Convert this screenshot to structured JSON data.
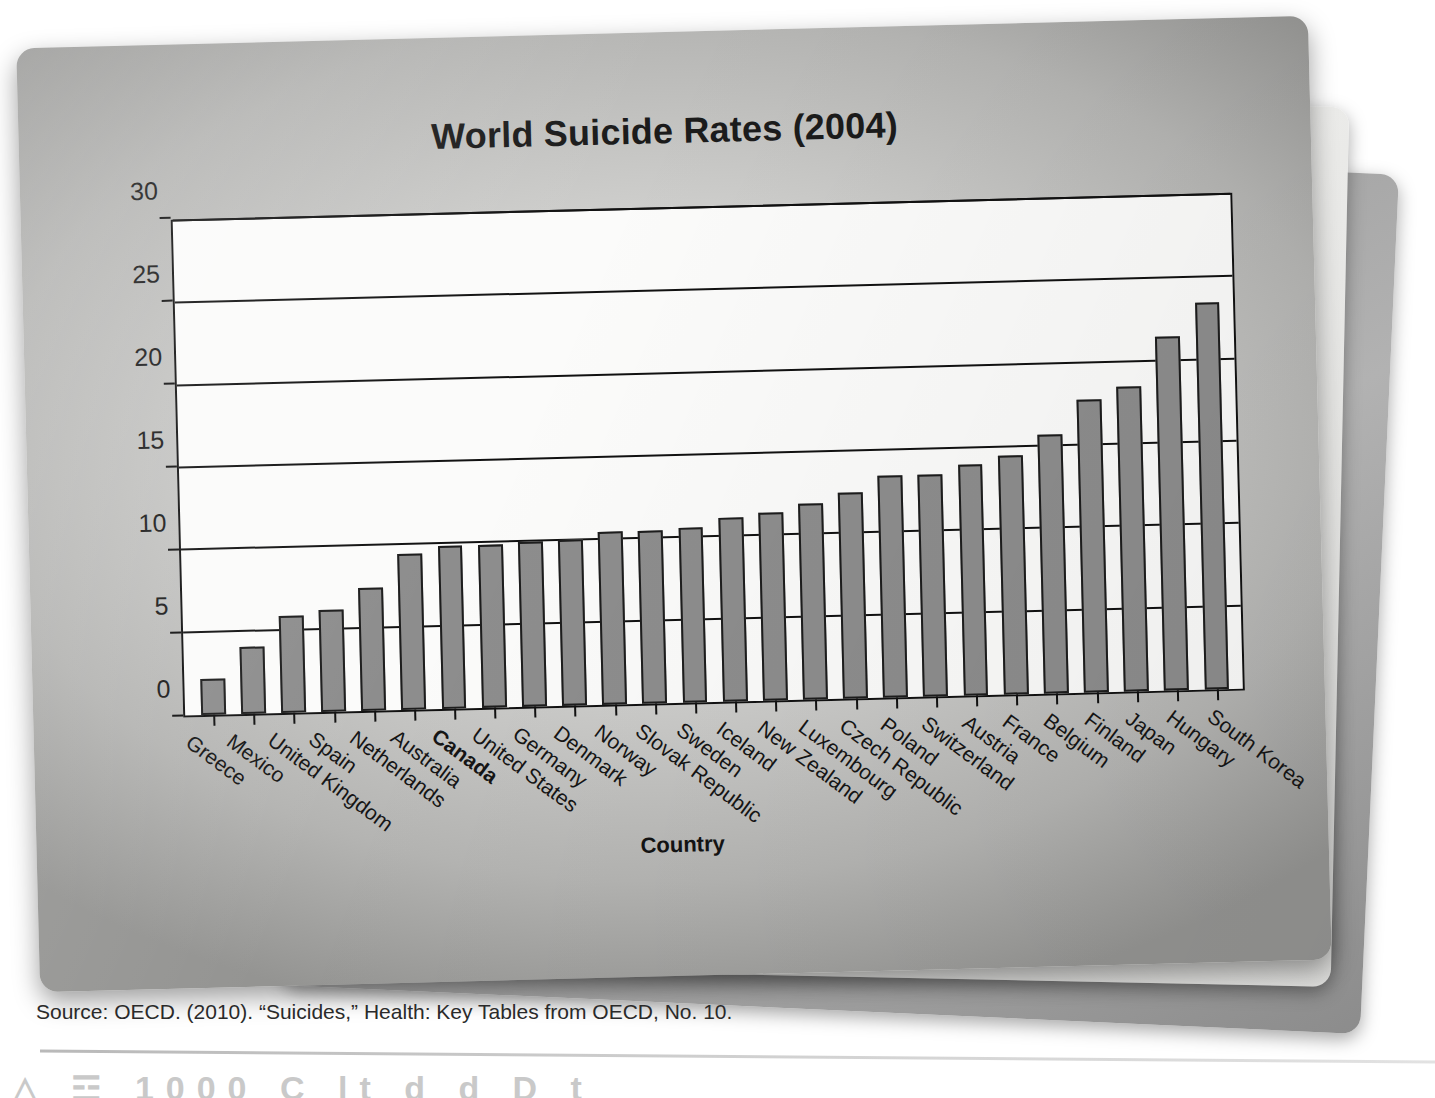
{
  "chart_data": {
    "type": "bar",
    "title": "World Suicide Rates (2004)",
    "xlabel": "Country",
    "ylabel": "Suicide rate per 100 000 people",
    "ylim": [
      0,
      30
    ],
    "yticks": [
      0,
      5,
      10,
      15,
      20,
      25,
      30
    ],
    "grid": true,
    "legend": "none",
    "highlight_category": "Canada",
    "bar_color": "#8d8d8d",
    "bar_edge_color": "#1d1d1d",
    "categories": [
      "Greece",
      "Mexico",
      "United Kingdom",
      "Spain",
      "Netherlands",
      "Australia",
      "Canada",
      "United States",
      "Germany",
      "Denmark",
      "Norway",
      "Slovak Republic",
      "Sweden",
      "Iceland",
      "New Zealand",
      "Luxembourg",
      "Czech Republic",
      "Poland",
      "Switzerland",
      "Austria",
      "France",
      "Belgium",
      "Finland",
      "Japan",
      "Hungary",
      "South Korea"
    ],
    "values": [
      2.2,
      4.1,
      5.9,
      6.2,
      7.5,
      9.5,
      9.9,
      9.9,
      10.0,
      10.1,
      10.5,
      10.5,
      10.6,
      11.2,
      11.4,
      11.9,
      12.5,
      13.5,
      13.5,
      14.0,
      14.5,
      15.7,
      17.8,
      18.5,
      21.5,
      23.5
    ]
  },
  "footer": {
    "source": "Source: OECD. (2010). “Suicides,” Health: Key Tables from OECD, No. 10.",
    "cut_text": "△ ☲    1000 C      lt          d    d  D t"
  }
}
